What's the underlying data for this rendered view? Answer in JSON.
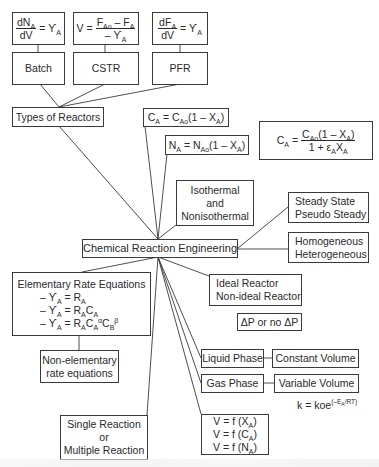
{
  "diagram": {
    "center": {
      "label": "Chemical Reaction Engineering"
    },
    "types_of_reactors": {
      "label": "Types of Reactors",
      "reactors": [
        {
          "name": "Batch",
          "equation": {
            "num": "dN",
            "num_sub": "A",
            "den": "dV",
            "rhs": "= ϒ",
            "rhs_sub": "A"
          }
        },
        {
          "name": "CSTR",
          "equation": {
            "lhs": "V =",
            "num": "F",
            "num_sub": "Ao",
            "num_rest": " – F",
            "num_rest_sub": "A",
            "den": "– ϒ",
            "den_sub": "A"
          }
        },
        {
          "name": "PFR",
          "equation": {
            "num": "dF",
            "num_sub": "A",
            "den": "dV",
            "rhs": "= ϒ",
            "rhs_sub": "A"
          }
        }
      ]
    },
    "concentration_eqs": {
      "ca_liquid": {
        "a": "C",
        "a_sub": "A",
        "mid": " = C",
        "mid_sub": "Ao",
        "tail": "(1 – X",
        "tail_sub": "A",
        "end": ")"
      },
      "na": {
        "a": "N",
        "a_sub": "A",
        "mid": " = N",
        "mid_sub": "Ao",
        "tail": "(1 – X",
        "tail_sub": "A",
        "end": ")"
      },
      "ca_gas": {
        "lhs": "C",
        "lhs_sub": "A",
        "eq": "=",
        "num": "C",
        "num_sub": "Ao",
        "num_rest": "(1 – X",
        "num_rest_sub": "A",
        "num_end": ")",
        "den": "1 + ε",
        "den_sub": "A",
        "den_rest": "X",
        "den_rest_sub": "A"
      }
    },
    "thermal": {
      "line1": "Isothermal",
      "line2": "and",
      "line3": "Nonisothermal"
    },
    "steady": {
      "line1": "Steady State",
      "line2": "Pseudo Steady"
    },
    "phase_type": {
      "line1": "Homogeneous",
      "line2": "Heterogeneous"
    },
    "rate_equations": {
      "title": "Elementary Rate Equations",
      "eqs": [
        {
          "lhs": "– ϒ",
          "lhs_sub": "A",
          "rhs": " = R",
          "rhs_sub": "A"
        },
        {
          "lhs": "– ϒ",
          "lhs_sub": "A",
          "rhs": " = R",
          "rhs_sub": "A",
          "extra": "C",
          "extra_sub": "A"
        },
        {
          "lhs": "– ϒ",
          "lhs_sub": "A",
          "rhs": " = R",
          "rhs_sub": "A",
          "extra": "C",
          "extra_sub": "A",
          "extra_sup": "α",
          "extra2": "C",
          "extra2_sub": "B",
          "extra2_sup": "β"
        }
      ],
      "non_elementary": {
        "line1": "Non-elementary",
        "line2": "rate equations"
      }
    },
    "ideal": {
      "line1": "Ideal Reactor",
      "line2": "Non-ideal Reactor"
    },
    "pressure_drop": {
      "label": "ΔP or no ΔP"
    },
    "liquid_phase": {
      "label": "Liquid Phase",
      "volume": "Constant Volume"
    },
    "gas_phase": {
      "label": "Gas Phase",
      "volume": "Variable Volume"
    },
    "arrhenius": {
      "k": "k = koe",
      "exp": "(–E",
      "exp_sub": "A",
      "exp_end": "/RT)"
    },
    "volume_functions": [
      {
        "lhs": "V = f (X",
        "sub": "A",
        "end": ")"
      },
      {
        "lhs": "V = f (C",
        "sub": "A",
        "end": ")"
      },
      {
        "lhs": "V = f (N",
        "sub": "A",
        "end": ")"
      }
    ],
    "reactions": {
      "line1": "Single Reaction",
      "line2": "or",
      "line3": "Multiple Reaction"
    },
    "colors": {
      "line": "#3a3a3a",
      "text": "#2a2a2a",
      "background": "#ffffff"
    }
  }
}
